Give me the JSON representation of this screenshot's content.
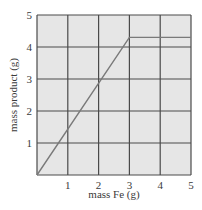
{
  "chart_data": {
    "type": "line",
    "title": "",
    "xlabel": "mass Fe (g)",
    "ylabel": "mass product (g)",
    "xlim": [
      0,
      5
    ],
    "ylim": [
      0,
      5
    ],
    "x_ticks": [
      "1",
      "2",
      "3",
      "4",
      "5"
    ],
    "y_ticks": [
      "1",
      "2",
      "3",
      "4",
      "5"
    ],
    "grid": true,
    "legend": null,
    "series": [
      {
        "name": "mass product",
        "x": [
          0,
          3,
          5
        ],
        "y": [
          0,
          4.3,
          4.3
        ]
      }
    ]
  },
  "colors": {
    "plot_background": "#e6e6e6",
    "grid": "#4a4a4a",
    "line": "#7a7a7a",
    "text": "#3a3a3a"
  }
}
